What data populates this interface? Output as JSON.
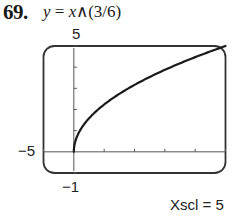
{
  "problem": {
    "number": "69.",
    "equation_lhs": "y",
    "equation_eq": " = ",
    "equation_var": "x",
    "equation_rhs": "∧(3/6)"
  },
  "window": {
    "ymax_label": "5",
    "xmin_label": "−5",
    "ymin_label": "−1",
    "xscl_label": "Xscl = 5"
  },
  "chart_data": {
    "type": "line",
    "title": "y = x∧(3/6)",
    "function": "y = x^(3/6) = sqrt(x)",
    "xlabel": "",
    "ylabel": "",
    "xlim": [
      -5,
      25
    ],
    "ylim": [
      -1,
      5
    ],
    "xscl": 5,
    "yscl": 1,
    "grid": false,
    "legend": null,
    "x_ticks": [
      5,
      10,
      15,
      20,
      25
    ],
    "y_ticks": [
      1,
      2,
      3,
      4,
      5
    ],
    "series": [
      {
        "name": "y = x^(3/6)",
        "x": [
          0,
          0.25,
          1,
          2,
          4,
          6,
          9,
          12,
          16,
          20,
          25
        ],
        "y": [
          0,
          0.5,
          1,
          1.41,
          2,
          2.45,
          3,
          3.46,
          4,
          4.47,
          5
        ]
      }
    ],
    "annotations": [
      "5",
      "−5",
      "−1",
      "Xscl = 5"
    ],
    "colors": {
      "curve": "#1a1a1a",
      "axes": "#555555",
      "frame": "#333333"
    }
  }
}
